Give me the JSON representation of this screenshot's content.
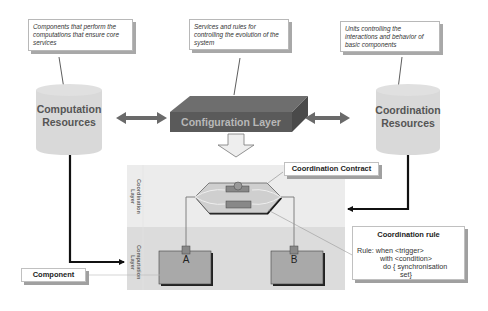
{
  "notes": {
    "computation": "Components that perform the computations that ensure core services",
    "configuration": "Services and rules for controlling the evolution of the system",
    "coordination": "Units controlling the interactions and behavior of basic components"
  },
  "resources": {
    "computation_line1": "Computation",
    "computation_line2": "Resources",
    "coordination_line1": "Coordination",
    "coordination_line2": "Resources"
  },
  "configuration_layer": "Configuration Layer",
  "layers": {
    "coordination_line1": "Coordination",
    "coordination_line2": "Layer",
    "computation_line1": "Computation",
    "computation_line2": "Layer"
  },
  "labels": {
    "coordination_contract": "Coordination Contract",
    "component": "Component"
  },
  "components": {
    "a": "A",
    "b": "B"
  },
  "rule": {
    "title": "Coordination rule",
    "line1": "Rule: when <trigger>",
    "line2": "with <condition>",
    "line3": "do { synchronisation",
    "line4": "set}"
  },
  "colors": {
    "cylinder": "#d9d9d9",
    "configuration_block": "#5a5a5a",
    "coordination_layer_bg": "#ececec",
    "computation_layer_bg": "#dcdcdc",
    "component_box": "#a9a9a9",
    "arrow": "#666666"
  }
}
